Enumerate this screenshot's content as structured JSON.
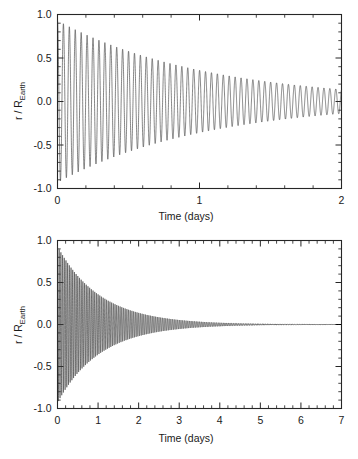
{
  "figure": {
    "background_color": "#ffffff",
    "curve_color": "#3a3a3a",
    "axis_color": "#262626"
  },
  "chart_data": [
    {
      "type": "line",
      "panel": "top",
      "title": "",
      "xlabel": "Time (days)",
      "ylabel_main": "r / R",
      "ylabel_sub": "Earth",
      "ylabel": "r / R_Earth",
      "xlim": [
        0,
        2
      ],
      "ylim": [
        -1.0,
        1.0
      ],
      "xticks": [
        0,
        1,
        2
      ],
      "xtick_labels": [
        "0",
        "1",
        "2"
      ],
      "yticks": [
        -1.0,
        -0.5,
        0.0,
        0.5,
        1.0
      ],
      "ytick_labels": [
        "-1.0",
        "-0.5",
        "0.0",
        "0.5",
        "1.0"
      ],
      "x_minor_per_interval": 5,
      "y_minor_per_interval": 5,
      "grid": false,
      "legend": null,
      "description": "Damped sinusoidal oscillation of normalized radius r/R_Earth versus time, decaying from amplitude ~0.93 at t=0 to ~0.15 at t=2 days.",
      "model": {
        "form": "A0 * exp(-t / tau) * cos(2*pi*t / period)",
        "amplitude_initial": 0.93,
        "decay_tau_days": 1.05,
        "period_days": 0.0417,
        "cycles_per_day": 24,
        "offset": 0.0
      },
      "envelope_samples": {
        "t_days": [
          0.0,
          0.25,
          0.5,
          0.75,
          1.0,
          1.25,
          1.5,
          1.75,
          2.0
        ],
        "amplitude": [
          0.93,
          0.73,
          0.58,
          0.46,
          0.36,
          0.29,
          0.23,
          0.18,
          0.145
        ]
      }
    },
    {
      "type": "line",
      "panel": "bottom",
      "title": "",
      "xlabel": "Time (days)",
      "ylabel_main": "r / R",
      "ylabel_sub": "Earth",
      "ylabel": "r / R_Earth",
      "xlim": [
        0,
        7
      ],
      "ylim": [
        -1.0,
        1.0
      ],
      "xticks": [
        0,
        1,
        2,
        3,
        4,
        5,
        6,
        7
      ],
      "xtick_labels": [
        "0",
        "1",
        "2",
        "3",
        "4",
        "5",
        "6",
        "7"
      ],
      "yticks": [
        -1.0,
        -0.5,
        0.0,
        0.5,
        1.0
      ],
      "ytick_labels": [
        "-1.0",
        "-0.5",
        "0.0",
        "0.5",
        "1.0"
      ],
      "x_minor_per_interval": 5,
      "y_minor_per_interval": 5,
      "grid": false,
      "legend": null,
      "description": "Same damped oscillation shown over the full 0 to 7 day span; amplitude decays to essentially zero by about 5 days.",
      "model": {
        "form": "A0 * exp(-t / tau) * cos(2*pi*t / period)",
        "amplitude_initial": 0.93,
        "decay_tau_days": 1.05,
        "period_days": 0.0417,
        "cycles_per_day": 24,
        "offset": 0.0
      },
      "envelope_samples": {
        "t_days": [
          0.0,
          0.5,
          1.0,
          1.5,
          2.0,
          2.5,
          3.0,
          3.5,
          4.0,
          4.5,
          5.0,
          6.0,
          7.0
        ],
        "amplitude": [
          0.93,
          0.58,
          0.36,
          0.23,
          0.145,
          0.09,
          0.056,
          0.035,
          0.022,
          0.014,
          0.008,
          0.003,
          0.001
        ]
      }
    }
  ]
}
